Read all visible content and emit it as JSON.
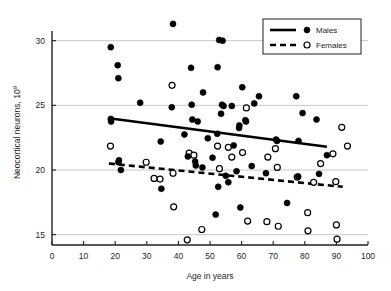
{
  "chart_data": {
    "type": "scatter",
    "title": "",
    "xlabel": "Age in years",
    "ylabel": "Neocortical neurons, 10",
    "ylabel_exponent": "9",
    "xlim": [
      0,
      100
    ],
    "ylim": [
      14.2,
      31.6
    ],
    "xticks": [
      0,
      10,
      20,
      30,
      40,
      50,
      60,
      70,
      80,
      90,
      100
    ],
    "yticks": [
      15,
      20,
      25,
      30
    ],
    "grid": "horizontal",
    "legend_position": "top-right",
    "colors": {
      "males_marker_fill": "#000000",
      "females_marker_fill": "#ffffff",
      "marker_stroke": "#000000",
      "grid": "#b9b9b9",
      "axis": "#231f20",
      "background": "#ffffff"
    },
    "series": [
      {
        "name": "Males",
        "marker": "filled-circle",
        "line_style": "solid",
        "points": [
          [
            18.6,
            23.95
          ],
          [
            18.7,
            23.75
          ],
          [
            18.6,
            29.5
          ],
          [
            20.8,
            28.1
          ],
          [
            21.0,
            27.1
          ],
          [
            21.8,
            20.0
          ],
          [
            21.0,
            20.6
          ],
          [
            21.2,
            20.75
          ],
          [
            27.9,
            25.2
          ],
          [
            34.4,
            22.2
          ],
          [
            34.6,
            18.55
          ],
          [
            37.9,
            24.85
          ],
          [
            38.3,
            31.3
          ],
          [
            41.9,
            22.75
          ],
          [
            43.0,
            21.05
          ],
          [
            44.4,
            23.9
          ],
          [
            44.2,
            25.05
          ],
          [
            44.0,
            27.9
          ],
          [
            45.3,
            20.65
          ],
          [
            45.5,
            20.35
          ],
          [
            46.1,
            23.75
          ],
          [
            47.6,
            20.2
          ],
          [
            47.8,
            26.0
          ],
          [
            49.3,
            22.45
          ],
          [
            50.8,
            20.95
          ],
          [
            51.8,
            16.55
          ],
          [
            52.3,
            22.8
          ],
          [
            52.4,
            27.95
          ],
          [
            52.6,
            18.7
          ],
          [
            52.9,
            30.05
          ],
          [
            53.5,
            24.35
          ],
          [
            53.8,
            25.05
          ],
          [
            54.0,
            30.0
          ],
          [
            54.3,
            24.95
          ],
          [
            55.0,
            19.55
          ],
          [
            55.8,
            19.05
          ],
          [
            56.9,
            24.95
          ],
          [
            57.5,
            21.9
          ],
          [
            58.4,
            19.9
          ],
          [
            59.2,
            23.25
          ],
          [
            59.3,
            23.45
          ],
          [
            59.6,
            17.1
          ],
          [
            60.2,
            26.4
          ],
          [
            61.2,
            23.85
          ],
          [
            61.4,
            23.75
          ],
          [
            63.2,
            20.3
          ],
          [
            64.0,
            25.15
          ],
          [
            65.5,
            25.7
          ],
          [
            67.7,
            19.75
          ],
          [
            70.9,
            22.35
          ],
          [
            71.2,
            22.25
          ],
          [
            74.4,
            17.45
          ],
          [
            77.3,
            25.7
          ],
          [
            77.9,
            19.5
          ],
          [
            78.0,
            22.25
          ],
          [
            79.3,
            24.4
          ],
          [
            83.7,
            23.9
          ],
          [
            84.5,
            19.7
          ],
          [
            87.0,
            21.15
          ]
        ],
        "trend_line": {
          "x1": 18,
          "y1": 24.0,
          "x2": 87,
          "y2": 21.8
        }
      },
      {
        "name": "Females",
        "marker": "open-circle",
        "line_style": "dashed",
        "points": [
          [
            18.5,
            21.85
          ],
          [
            29.8,
            20.6
          ],
          [
            32.3,
            19.35
          ],
          [
            34.2,
            19.3
          ],
          [
            38.0,
            26.55
          ],
          [
            38.3,
            19.75
          ],
          [
            38.5,
            17.15
          ],
          [
            42.8,
            14.6
          ],
          [
            43.4,
            21.3
          ],
          [
            44.9,
            21.15
          ],
          [
            47.4,
            15.4
          ],
          [
            52.4,
            21.85
          ],
          [
            53.0,
            20.1
          ],
          [
            55.8,
            21.75
          ],
          [
            56.9,
            21.0
          ],
          [
            60.3,
            21.35
          ],
          [
            61.5,
            24.8
          ],
          [
            61.9,
            16.05
          ],
          [
            68.0,
            16.0
          ],
          [
            68.3,
            21.0
          ],
          [
            70.7,
            21.65
          ],
          [
            71.3,
            20.2
          ],
          [
            71.6,
            15.65
          ],
          [
            77.6,
            19.45
          ],
          [
            80.9,
            16.7
          ],
          [
            81.0,
            15.3
          ],
          [
            82.8,
            19.05
          ],
          [
            85.0,
            20.5
          ],
          [
            88.9,
            21.25
          ],
          [
            89.8,
            19.1
          ],
          [
            90.0,
            15.75
          ],
          [
            90.2,
            14.65
          ],
          [
            91.7,
            23.3
          ],
          [
            93.5,
            21.85
          ]
        ],
        "trend_line": {
          "x1": 18,
          "y1": 20.5,
          "x2": 92,
          "y2": 18.7
        }
      }
    ]
  },
  "legend": {
    "items": [
      {
        "label": "Males",
        "marker": "filled-circle",
        "line": "solid"
      },
      {
        "label": "Females",
        "marker": "open-circle",
        "line": "dashed"
      }
    ]
  }
}
